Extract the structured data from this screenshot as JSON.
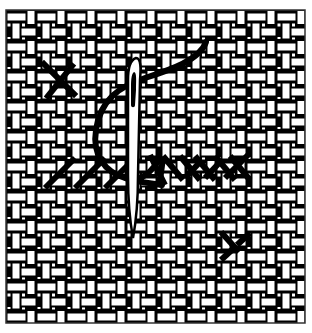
{
  "figure": {
    "subject": "Cross-stitch needlework on woven canvas",
    "elements": [
      "woven-canvas",
      "single-cross-stitch",
      "needle",
      "thread",
      "row-of-half-cross-stitches",
      "half-stitch-lower-right"
    ]
  },
  "colors": {
    "background": "#ffffff",
    "ink": "#000000",
    "frame": "#333333"
  },
  "frame": {
    "x": 6,
    "y": 10,
    "width": 299,
    "height": 313
  }
}
